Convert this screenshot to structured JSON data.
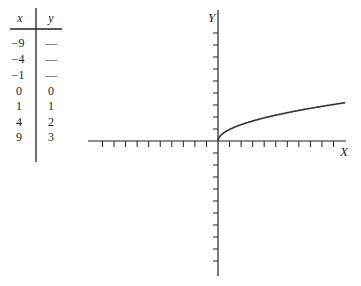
{
  "table": {
    "headers": {
      "x": "x",
      "y": "y"
    },
    "rows": [
      {
        "x": "−9",
        "y": "—"
      },
      {
        "x": "−4",
        "y": "—"
      },
      {
        "x": "−1",
        "y": "—"
      },
      {
        "x": "0",
        "y": "0"
      },
      {
        "x": "1",
        "y": "1"
      },
      {
        "x": "4",
        "y": "2"
      },
      {
        "x": "9",
        "y": "3"
      }
    ]
  },
  "graph": {
    "x_axis_label": "X",
    "y_axis_label": "Y",
    "function": "y = sqrt(x)",
    "x_ticks_left": 10,
    "x_ticks_right": 10,
    "y_ticks_up": 9,
    "y_ticks_down": 10,
    "line_color": "#333333"
  },
  "chart_data": {
    "type": "line",
    "title": "",
    "xlabel": "X",
    "ylabel": "Y",
    "x": [
      0,
      1,
      2,
      3,
      4,
      5,
      6,
      7,
      8,
      9,
      10,
      11
    ],
    "series": [
      {
        "name": "y = √x",
        "values": [
          0,
          1,
          1.414,
          1.732,
          2,
          2.236,
          2.449,
          2.646,
          2.828,
          3,
          3.162,
          3.317
        ]
      }
    ],
    "xlim": [
      -11,
      11
    ],
    "ylim": [
      -11.5,
      11
    ],
    "grid": false,
    "legend": "none"
  }
}
